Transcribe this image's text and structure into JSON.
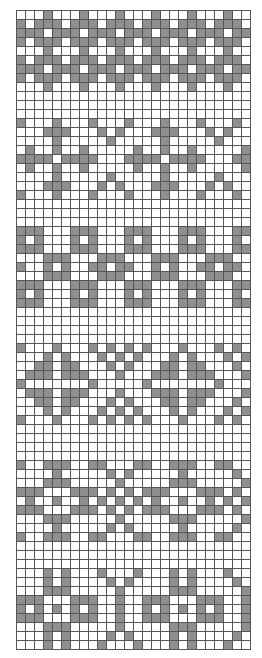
{
  "chart": {
    "type": "knitting-colorwork-chart",
    "columns": 26,
    "rows_count": 71,
    "colors": {
      "background": "#ffffff",
      "contrast": "#8f8f8f",
      "grid_line": "#555555"
    },
    "legend": {
      "dark": "#",
      "light": "."
    },
    "rows": [
      "...#...#...#...#...#...#..",
      "#.###.###.###.###.###.###.",
      "###.###.###.###.###.###.##",
      "#.###.###.###.###.###.###.",
      "...#...#...#...#...#...#..",
      "#.###.###.###.###.###.###.",
      "###.###.###.###.###.###.##",
      "#.###.###.###.###.###.###.",
      "...#...#...#...#...#...#..",
      "..........................",
      "..........................",
      "..........................",
      "#...#...#...#...#...#...#.",
      "...###...#.#...###...#.#..",
      "....#.....#.....#.....#...",
      ".#..#..#.....#..#..#.....#",
      "####.####...####.####...##",
      ".#..#..#.....#..#..#.....#",
      "....#.....#.....#.....#...",
      "...###...#.#...###...#.#..",
      "#...#...#...#...#...#...#.",
      "..........................",
      "..........................",
      "..........................",
      "###...###...###...###...##",
      "#.#...#.#...#.#...#.#...#.",
      "###...###...###...###...##",
      "...###...###...###...###..",
      "#..#.#..##.##..#.#..##.##.",
      "...###...###...###...###..",
      "###...###...###...###...##",
      "#.#...#.#...#.#...#.#...#.",
      "###...###...###...###...##",
      "..........................",
      "..........................",
      "..........................",
      "..........................",
      "#...#...#.#.#.#...#...#.#.",
      "...#.#...#.#.#...#.#...#.#",
      "..##.##...#.#...##.##...#.",
      ".###.###...#...###.###...#",
      "#.......#.....#.......#...",
      ".###.###...#...###.###...#",
      "..##.##...#.#...##.##...#.",
      "...#.#...#.#.#...#.#...#.#",
      "#...#...#.#.#.#...#...#.#.",
      "..........................",
      "..........................",
      "..........................",
      "..........................",
      "#..###..##...##..###..##..",
      "....#.....#.#.....#.....#.",
      "...###.....#.....###.....#",
      "###...###.#.#.###...###.#.",
      ".#..#..#.#.#.#.#..#..#.#.#",
      "###...###.#.#.###...###.#.",
      "...###.....#.....###.....#",
      "....#.....#.#.....#.....#.",
      "#..###..##...##..###..##..",
      "..........................",
      "..........................",
      "..........................",
      "...#.#...#...#...#.#...#..",
      "...#.#....#.#....#.#....#.",
      "...###.....#.....###.....#",
      "###...###..#..###...###..#",
      "#.#.#.#.#..#..#.#.#.#.#..#",
      "###...###..#..###...###..#",
      "...###.....#.....###.....#",
      "...#.#....#.#....#.#....#.",
      "...#.#...#...#...#.#...#.."
    ]
  }
}
